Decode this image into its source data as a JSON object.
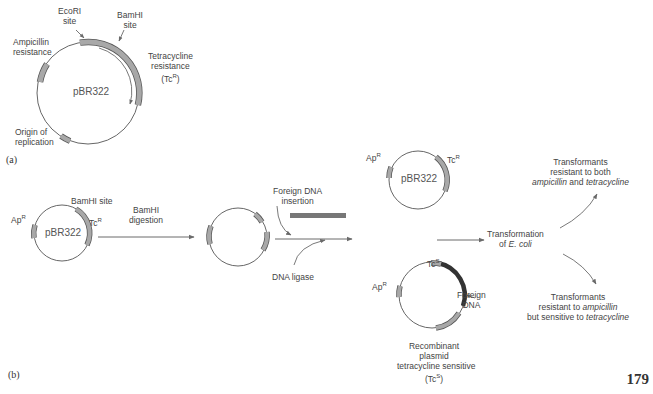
{
  "panel_a": {
    "label": "(a)",
    "plasmid_name": "pBR322",
    "labels": {
      "ecori": [
        "EcoRI",
        "site"
      ],
      "bamhi": [
        "BamHI",
        "site"
      ],
      "ampicillin": [
        "Ampicillin",
        "resistance"
      ],
      "tetracycline": [
        "Tetracycline",
        "resistance",
        "(Tc",
        "R",
        ")"
      ],
      "origin": [
        "Origin of",
        "replication"
      ]
    }
  },
  "panel_b": {
    "label": "(b)",
    "step1": {
      "plasmid_name": "pBR322",
      "ap": "Ap",
      "ap_sup": "R",
      "tc": "Tc",
      "tc_sup": "R",
      "bamhi": "BamHI site"
    },
    "arrow1_label": [
      "BamHI",
      "digestion"
    ],
    "insertion_label": [
      "Foreign DNA",
      "insertion"
    ],
    "ligase_label": "DNA ligase",
    "result_top": {
      "plasmid_name": "pBR322",
      "ap": "Ap",
      "ap_sup": "R",
      "tc": "Tc",
      "tc_sup": "R"
    },
    "result_bottom": {
      "ap": "Ap",
      "ap_sup": "R",
      "tc": "Tc",
      "tc_sup": "S",
      "foreign": [
        "Foreign",
        "DNA"
      ],
      "caption": [
        "Recombinant",
        "plasmid",
        "tetracycline sensitive",
        "(Tc",
        "S",
        ")"
      ]
    },
    "transformation": [
      "Transformation",
      "of ",
      "E. coli"
    ],
    "outcome_top": [
      "Transformants",
      "resistant to both",
      "ampicillin",
      " and ",
      "tetracycline"
    ],
    "outcome_bottom": [
      "Transformants",
      "resistant to ",
      "ampicillin",
      "but sensitive to ",
      "tetracycline"
    ]
  },
  "page_number": "179",
  "colors": {
    "line": "#555555",
    "gene_fill": "#a8a8a8",
    "gene_stroke": "#555555",
    "foreign_dna": "#777777",
    "arrow": "#6a6a6a"
  }
}
